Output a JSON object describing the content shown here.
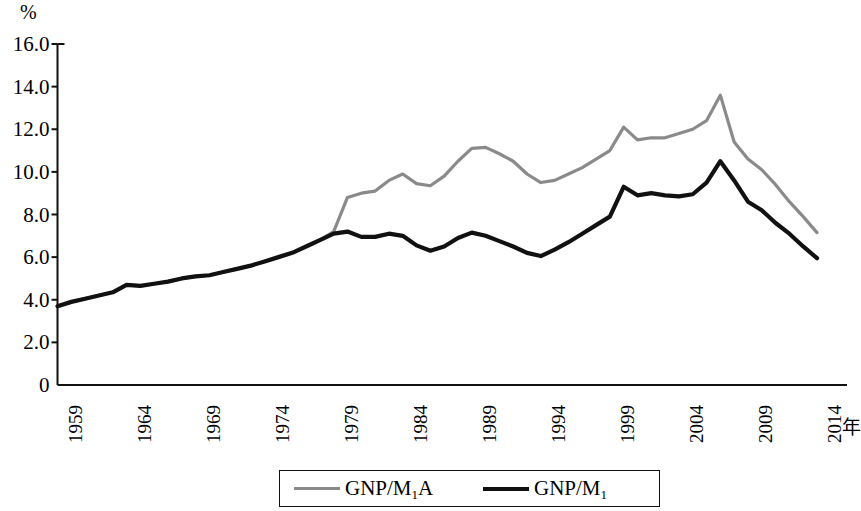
{
  "chart_data": {
    "type": "line",
    "title": "",
    "xlabel": "年",
    "ylabel": "%",
    "ylim": [
      0,
      16
    ],
    "xlim": [
      1959,
      2014
    ],
    "grid": false,
    "legend_position": "bottom",
    "y_ticks": [
      "16.0",
      "14.0",
      "12.0",
      "10.0",
      "8.0",
      "6.0",
      "4.0",
      "2.0",
      "0"
    ],
    "y_tick_values": [
      16.0,
      14.0,
      12.0,
      10.0,
      8.0,
      6.0,
      4.0,
      2.0,
      0
    ],
    "x_ticks": [
      "1959",
      "1964",
      "1969",
      "1974",
      "1979",
      "1984",
      "1989",
      "1994",
      "1999",
      "2004",
      "2009",
      "2014"
    ],
    "x_tick_values": [
      1959,
      1964,
      1969,
      1974,
      1979,
      1984,
      1989,
      1994,
      1999,
      2004,
      2009,
      2014
    ],
    "x": [
      1959,
      1960,
      1961,
      1962,
      1963,
      1964,
      1965,
      1966,
      1967,
      1968,
      1969,
      1970,
      1971,
      1972,
      1973,
      1974,
      1975,
      1976,
      1977,
      1978,
      1979,
      1980,
      1981,
      1982,
      1983,
      1984,
      1985,
      1986,
      1987,
      1988,
      1989,
      1990,
      1991,
      1992,
      1993,
      1994,
      1995,
      1996,
      1997,
      1998,
      1999,
      2000,
      2001,
      2002,
      2003,
      2004,
      2005,
      2006,
      2007,
      2008,
      2009,
      2010,
      2011,
      2012,
      2013,
      2014
    ],
    "series": [
      {
        "name": "GNP/M1A",
        "label_html": "GNP/M<sub>1</sub>A",
        "color": "#8a8a8a",
        "width": 3.2,
        "values": [
          3.7,
          3.9,
          4.05,
          4.2,
          4.35,
          4.7,
          4.65,
          4.75,
          4.85,
          5.0,
          5.1,
          5.15,
          5.3,
          5.45,
          5.6,
          5.8,
          6.0,
          6.2,
          6.5,
          6.8,
          7.2,
          8.8,
          9.0,
          9.1,
          9.6,
          9.9,
          9.45,
          9.35,
          9.8,
          10.5,
          11.1,
          11.15,
          10.85,
          10.5,
          9.9,
          9.5,
          9.6,
          9.9,
          10.2,
          10.6,
          11.0,
          12.1,
          11.5,
          11.6,
          11.6,
          11.8,
          12.0,
          12.4,
          13.6,
          11.4,
          10.6,
          10.1,
          9.4,
          8.6,
          7.9,
          7.15
        ]
      },
      {
        "name": "GNP/M1",
        "label_html": "GNP/M<sub>1</sub>",
        "color": "#111111",
        "width": 4.2,
        "values": [
          3.7,
          3.9,
          4.05,
          4.2,
          4.35,
          4.7,
          4.65,
          4.75,
          4.85,
          5.0,
          5.1,
          5.15,
          5.3,
          5.45,
          5.6,
          5.8,
          6.0,
          6.2,
          6.5,
          6.8,
          7.1,
          7.2,
          6.95,
          6.95,
          7.1,
          7.0,
          6.55,
          6.3,
          6.5,
          6.9,
          7.15,
          7.0,
          6.75,
          6.5,
          6.2,
          6.05,
          6.35,
          6.7,
          7.1,
          7.5,
          7.9,
          9.3,
          8.9,
          9.0,
          8.9,
          8.85,
          8.95,
          9.5,
          10.5,
          9.6,
          8.6,
          8.2,
          7.6,
          7.1,
          6.5,
          5.95
        ]
      }
    ]
  },
  "axes": {
    "y_unit": "%",
    "x_unit": "年"
  },
  "legend": {
    "items": [
      {
        "label": "GNP/M",
        "sub": "1",
        "suffix": "A",
        "color": "#8a8a8a"
      },
      {
        "label": "GNP/M",
        "sub": "1",
        "suffix": "",
        "color": "#111111"
      }
    ]
  }
}
